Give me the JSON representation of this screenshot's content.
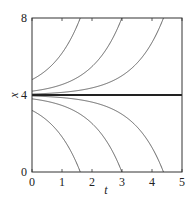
{
  "chart_data": {
    "type": "line",
    "title": "",
    "xlabel": "t",
    "ylabel": "x",
    "xlim": [
      0,
      5
    ],
    "ylim": [
      0,
      8
    ],
    "xticks": [
      0,
      1,
      2,
      3,
      4,
      5
    ],
    "yticks": [
      0,
      4,
      8
    ],
    "grid": false,
    "legend": null,
    "equilibrium": {
      "x": 4,
      "style": "bold"
    },
    "series": [
      {
        "name": "c=0.8",
        "x0": 4.8,
        "exits_at_t": 1.61,
        "exits_at_x": 8
      },
      {
        "name": "c=0.2",
        "x0": 4.2,
        "exits_at_t": 3.0,
        "exits_at_x": 8
      },
      {
        "name": "c=0.05",
        "x0": 4.05,
        "exits_at_t": 4.38,
        "exits_at_x": 8
      },
      {
        "name": "c=0",
        "x0": 4.0,
        "exits_at_t": null,
        "exits_at_x": null
      },
      {
        "name": "c=-0.05",
        "x0": 3.95,
        "exits_at_t": 4.38,
        "exits_at_x": 0
      },
      {
        "name": "c=-0.2",
        "x0": 3.8,
        "exits_at_t": 3.0,
        "exits_at_x": 0
      },
      {
        "name": "c=-0.8",
        "x0": 3.2,
        "exits_at_t": 1.61,
        "exits_at_x": 0
      }
    ]
  },
  "axes": {
    "x_tick_labels": [
      "0",
      "1",
      "2",
      "3",
      "4",
      "5"
    ],
    "y_tick_labels": [
      "0",
      "4",
      "8"
    ],
    "x_label": "t",
    "y_label": "x"
  },
  "style": {
    "curve_color": "#555555",
    "equilibrium_color": "#222222",
    "frame_color": "#333333"
  }
}
